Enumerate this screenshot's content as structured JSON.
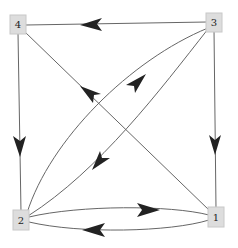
{
  "diagram": {
    "type": "directed-graph",
    "nodes": [
      {
        "id": "1",
        "label": "1",
        "x": 216,
        "y": 217
      },
      {
        "id": "2",
        "label": "2",
        "x": 21,
        "y": 220
      },
      {
        "id": "3",
        "label": "3",
        "x": 214,
        "y": 22
      },
      {
        "id": "4",
        "label": "4",
        "x": 18,
        "y": 25
      }
    ],
    "edges": [
      {
        "from": "3",
        "to": "4"
      },
      {
        "from": "4",
        "to": "2"
      },
      {
        "from": "3",
        "to": "1"
      },
      {
        "from": "1",
        "to": "4"
      },
      {
        "from": "2",
        "to": "3"
      },
      {
        "from": "3",
        "to": "2"
      },
      {
        "from": "2",
        "to": "1"
      },
      {
        "from": "1",
        "to": "2"
      }
    ],
    "colors": {
      "node_fill": "#dddddd",
      "node_stroke": "#c8c8c8",
      "edge": "#666666",
      "arrow": "#222222"
    }
  }
}
